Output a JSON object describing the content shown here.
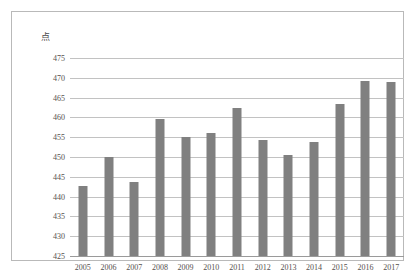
{
  "chart_data": {
    "type": "bar",
    "title": "",
    "subtitle": "",
    "xlabel": "",
    "ylabel": "点",
    "unit_label": "点",
    "categories": [
      "2005",
      "2006",
      "2007",
      "2008",
      "2009",
      "2010",
      "2011",
      "2012",
      "2013",
      "2014",
      "2015",
      "2016",
      "2017"
    ],
    "values": [
      442.7,
      450.0,
      443.7,
      459.7,
      455.0,
      456.0,
      462.5,
      454.3,
      450.5,
      453.7,
      463.5,
      469.3,
      469.0
    ],
    "series": [
      {
        "name": "",
        "values": [
          442.7,
          450.0,
          443.7,
          459.7,
          455.0,
          456.0,
          462.5,
          454.3,
          450.5,
          453.7,
          463.5,
          469.3,
          469.0
        ]
      }
    ],
    "ylim": [
      425,
      475
    ],
    "yticks": [
      425,
      430,
      435,
      440,
      445,
      450,
      455,
      460,
      465,
      470,
      475
    ],
    "ytick_labels": [
      "425",
      "430",
      "435",
      "440",
      "445",
      "450",
      "455",
      "460",
      "465",
      "470",
      "475"
    ],
    "grid": true,
    "grid_axis": "y",
    "legend": false,
    "legend_position": "none",
    "bar_color": "#808080",
    "gridline_color": "#c2c2c2",
    "axis_color": "#9a9a9a",
    "frame_color": "#b9b9b9",
    "text_color": "#55504e",
    "background_color": "#ffffff"
  }
}
